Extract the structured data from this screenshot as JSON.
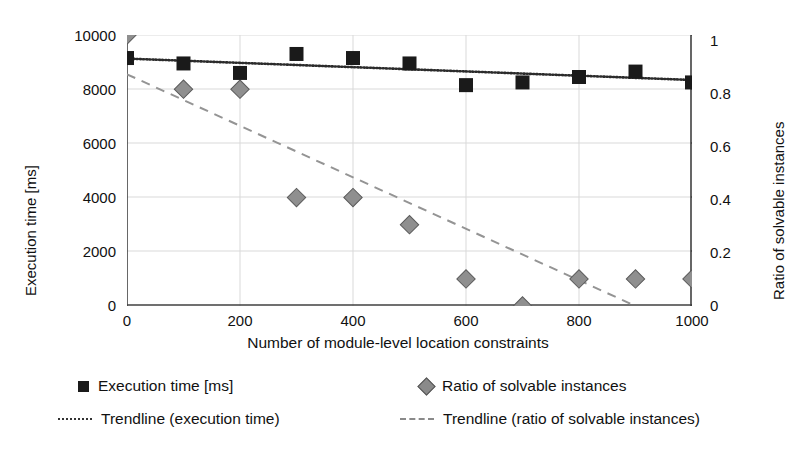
{
  "chart_data": {
    "type": "scatter",
    "title": "",
    "xlabel": "Number of module-level location constraints",
    "ylabel": "Execution time [ms]",
    "y2label": "Ratio of solvable instances",
    "x": [
      0,
      100,
      200,
      300,
      400,
      500,
      600,
      700,
      800,
      900,
      1000
    ],
    "xlim": [
      0,
      1000
    ],
    "ylim": [
      0,
      10000
    ],
    "y2lim": [
      0,
      1
    ],
    "xticks": [
      "0",
      "200",
      "400",
      "600",
      "800",
      "1000"
    ],
    "yticks": [
      "0",
      "2000",
      "4000",
      "6000",
      "8000",
      "10000"
    ],
    "y2ticks": [
      "0",
      "0.2",
      "0.4",
      "0.6",
      "0.8",
      "1"
    ],
    "grid": true,
    "legend_position": "bottom",
    "series": [
      {
        "name": "Execution time [ms]",
        "marker": "square",
        "color": "#1a1a1a",
        "axis": "left",
        "values": [
          9150,
          8950,
          8600,
          9300,
          9150,
          8950,
          8150,
          8250,
          8450,
          8650,
          8250
        ]
      },
      {
        "name": "Ratio of solvable instances",
        "marker": "diamond",
        "color": "#8a8a8a",
        "axis": "right",
        "values": [
          1.0,
          0.8,
          0.8,
          0.4,
          0.4,
          0.3,
          0.1,
          0.0,
          0.1,
          0.1,
          0.1
        ]
      },
      {
        "name": "Trendline (execution time)",
        "marker": "dotted-line",
        "color": "#333333",
        "axis": "left",
        "endpoints": [
          [
            0,
            9130
          ],
          [
            1000,
            8340
          ]
        ]
      },
      {
        "name": "Trendline (ratio of solvable instances)",
        "marker": "dashed-line",
        "color": "#8a8a8a",
        "axis": "right",
        "endpoints": [
          [
            0,
            0.855
          ],
          [
            900,
            0.0
          ]
        ]
      }
    ]
  },
  "legend": {
    "items": [
      {
        "label": "Execution time [ms]",
        "swatch": "square-marker-icon"
      },
      {
        "label": "Ratio of solvable instances",
        "swatch": "diamond-marker-icon"
      },
      {
        "label": "Trendline (execution time)",
        "swatch": "dotted-line-icon"
      },
      {
        "label": "Trendline (ratio of solvable instances)",
        "swatch": "dashed-line-icon"
      }
    ]
  }
}
